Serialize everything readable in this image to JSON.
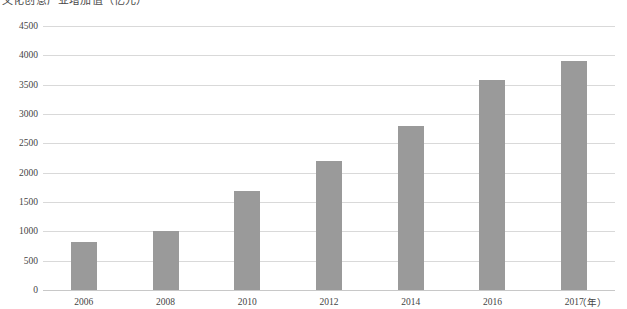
{
  "chart_data": {
    "type": "bar",
    "title": "文化创意产业增加值（亿元）",
    "xlabel": "（年）",
    "ylabel": "",
    "categories": [
      "2006",
      "2008",
      "2010",
      "2012",
      "2014",
      "2016",
      "2017"
    ],
    "values": [
      820,
      1000,
      1690,
      2200,
      2800,
      3580,
      3900
    ],
    "ylim": [
      0,
      4500
    ],
    "ytick_labels": [
      "4500",
      "4000",
      "3500",
      "3000",
      "2500",
      "2000",
      "1500",
      "1000",
      "500",
      "0"
    ],
    "ytick_values": [
      4500,
      4000,
      3500,
      3000,
      2500,
      2000,
      1500,
      1000,
      500,
      0
    ],
    "ytick_step": 500,
    "grid": true,
    "legend": null,
    "legend_position": "none",
    "series": [
      {
        "name": "文化创意产业增加值",
        "values": [
          820,
          1000,
          1690,
          2200,
          2800,
          3580,
          3900
        ]
      }
    ],
    "colors": {
      "bar": "#9a9a9a",
      "gridline": "#d9d9d9",
      "axis": "#c8c8c8",
      "text": "#444444",
      "background": "#ffffff"
    }
  }
}
